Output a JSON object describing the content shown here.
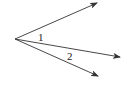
{
  "diagram": {
    "type": "angle-rays",
    "vertex": {
      "x": 15,
      "y": 39
    },
    "rays": [
      {
        "id": "top",
        "end": {
          "x": 97,
          "y": 3
        }
      },
      {
        "id": "middle",
        "end": {
          "x": 120,
          "y": 57
        }
      },
      {
        "id": "bottom",
        "end": {
          "x": 98,
          "y": 76
        }
      }
    ],
    "labels": [
      {
        "text": "1",
        "x": 38,
        "y": 41
      },
      {
        "text": "2",
        "x": 67,
        "y": 60
      }
    ],
    "colors": {
      "line": "#333333",
      "text": "#222222",
      "background": "#ffffff"
    }
  }
}
